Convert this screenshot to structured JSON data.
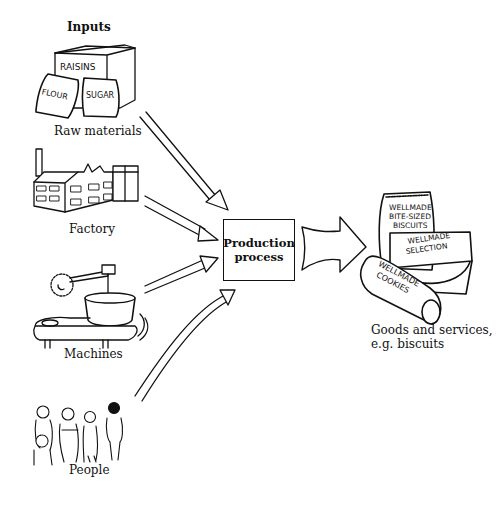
{
  "diagram": {
    "title": "Inputs",
    "inputs": [
      {
        "id": "raw-materials",
        "label": "Raw materials",
        "illustration_text": [
          "RAISINS",
          "FLOUR",
          "SUGAR"
        ]
      },
      {
        "id": "factory",
        "label": "Factory"
      },
      {
        "id": "machines",
        "label": "Machines"
      },
      {
        "id": "people",
        "label": "People"
      }
    ],
    "process": {
      "line1": "Production",
      "line2": "process"
    },
    "output": {
      "line1": "Goods and services,",
      "line2": "e.g. biscuits",
      "illustration_text": [
        "WELLMADE",
        "BITE-SIZED",
        "BISCUITS",
        "WELLMADE",
        "SELECTION",
        "WELLMADE",
        "COOKIES"
      ]
    },
    "colors": {
      "ink": "#111111",
      "background": "#ffffff"
    }
  }
}
